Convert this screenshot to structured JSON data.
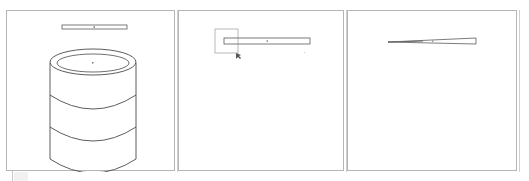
{
  "app": {
    "type": "cad-multi-viewport"
  },
  "viewports": [
    {
      "id": "vp1",
      "view": "perspective",
      "objects": [
        "thin-bar",
        "cylinder"
      ],
      "cylinder_bands": 3
    },
    {
      "id": "vp2",
      "view": "top",
      "objects": [
        "thin-bar"
      ],
      "selection_box": true,
      "cursor": "resize-cursor"
    },
    {
      "id": "vp3",
      "view": "side",
      "objects": [
        "tapered-bar"
      ]
    }
  ],
  "colors": {
    "line": "#5a5a5a",
    "border": "#b5b5b5",
    "selection": "#8a8a8a",
    "background": "#ffffff"
  }
}
